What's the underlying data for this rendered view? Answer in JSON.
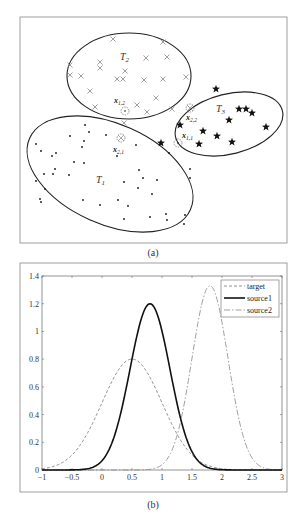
{
  "panel_a": {
    "caption": "(a)",
    "clusters": [
      {
        "name": "T1",
        "label_main": "T",
        "label_sub": "1",
        "marker": "dot"
      },
      {
        "name": "T2",
        "label_main": "T",
        "label_sub": "2",
        "marker": "cross"
      },
      {
        "name": "T3",
        "label_main": "T",
        "label_sub": "3",
        "marker": "star"
      }
    ],
    "annotations": [
      {
        "main": "x",
        "sub": "1,2"
      },
      {
        "main": "x",
        "sub": "2,1"
      },
      {
        "main": "x",
        "sub": "2,2"
      },
      {
        "main": "x",
        "sub": "1,1"
      }
    ]
  },
  "panel_b": {
    "caption": "(b)"
  },
  "chart_data": [
    {
      "type": "scatter",
      "title": "",
      "caption": "(a)",
      "series": [
        {
          "name": "T1",
          "marker": "dot",
          "region": "ellipse lower-left"
        },
        {
          "name": "T2",
          "marker": "cross",
          "region": "ellipse top-center"
        },
        {
          "name": "T3",
          "marker": "star",
          "region": "ellipse right"
        }
      ],
      "annotations": [
        "x1,2",
        "x2,1",
        "x2,2",
        "x1,1"
      ],
      "axes": "none"
    },
    {
      "type": "line",
      "caption": "(b)",
      "title": "",
      "xlabel": "",
      "ylabel": "",
      "xlim": [
        -1,
        3
      ],
      "ylim": [
        0,
        1.4
      ],
      "xticks": [
        "-1",
        "-0.5",
        "0",
        "0.5",
        "1",
        "1.5",
        "2",
        "2.5",
        "3"
      ],
      "yticks": [
        "0",
        "0.2",
        "0.4",
        "0.6",
        "0.8",
        "1",
        "1.2",
        "1.4"
      ],
      "grid": false,
      "legend_position": "top-right",
      "series": [
        {
          "name": "target",
          "style": "dashed",
          "distribution": "gaussian",
          "mean": 0.5,
          "sigma": 0.5,
          "peak": 0.8
        },
        {
          "name": "source1",
          "style": "solid-thick",
          "distribution": "gaussian",
          "mean": 0.8,
          "sigma": 0.333,
          "peak": 1.2
        },
        {
          "name": "source2",
          "style": "dash-dot",
          "distribution": "gaussian",
          "mean": 1.8,
          "sigma": 0.3,
          "peak": 1.33
        }
      ]
    }
  ]
}
